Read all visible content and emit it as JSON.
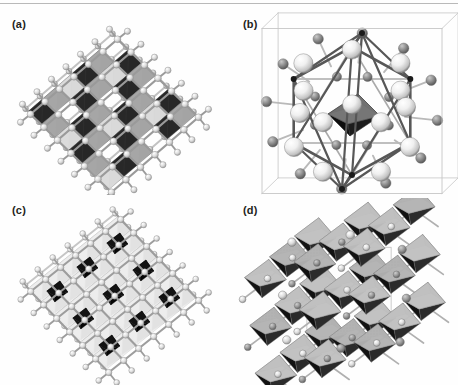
{
  "figure": {
    "type": "crystal-structure-figure",
    "background_color": "#fefefe",
    "top_rule_color": "#b9b9b9",
    "width": 458,
    "height": 385,
    "panel_count": 4,
    "layout": "2x2 grid"
  },
  "panels": [
    {
      "id": "a",
      "label": "(a)",
      "label_x": 12,
      "label_y": 22,
      "description": "Ball-and-stick crystal framework with black tetrahedra and gray tetrahedra arranged in diagonal chains",
      "render": "ball-stick-tetrahedra",
      "dark_polyhedra_color": "#121212",
      "mid_polyhedra_color": "#8f8f8f",
      "light_polyhedra_color": "#cfcfcf",
      "sphere_color": "#d8d8d8",
      "bond_color": "#9a9a9a",
      "cx": 112,
      "cy": 105,
      "sphere_radius": 3.4,
      "rows": 7,
      "cols": 7,
      "ax": 14.5,
      "ay": -12.5,
      "bx": 13.5,
      "by": 13.0
    },
    {
      "id": "b",
      "label": "(b)",
      "label_x": 243,
      "label_y": 22,
      "description": "Single unit cell in thin outlined box, large white cation spheres, small gray anion spheres, dark bond cage, central shaded octahedron",
      "render": "unit-cell-box",
      "box_color": "#c6c6c6",
      "cage_color": "#575757",
      "large_sphere_color": "#f2f2f2",
      "small_sphere_color": "#8a8a8a",
      "octahedron_top_color": "#8d8d8d",
      "octahedron_bottom_color": "#0e0e0e",
      "cx": 352,
      "cy": 103,
      "box_width": 180,
      "box_height": 165
    },
    {
      "id": "c",
      "label": "(c)",
      "label_x": 12,
      "label_y": 212,
      "description": "Ball-and-stick framework with black octahedral clusters and very light gray tetrahedra in a checkerboard arrangement",
      "render": "ball-stick-octahedra",
      "dark_polyhedra_color": "#101010",
      "mid_polyhedra_color": "#9d9d9d",
      "light_polyhedra_color": "#e2e2e2",
      "sphere_color": "#dedede",
      "bond_color": "#9d9d9d",
      "cx": 112,
      "cy": 293,
      "sphere_radius": 3.2,
      "rows": 7,
      "cols": 7,
      "ax": 15.0,
      "ay": -12.0,
      "bx": 13.0,
      "by": 13.5
    },
    {
      "id": "d",
      "label": "(d)",
      "label_x": 243,
      "label_y": 212,
      "description": "Dense 3x3 array of corner-sharing octahedra with light gray faces, stippled dotted faces and black shadowed faces, interconnected by gray spheres and bonds",
      "render": "octahedra-array",
      "face_light_color": "#c9c9c9",
      "face_mid_color": "#a6a6a6",
      "face_dark_color": "#121212",
      "stipple_color": "#6e6e6e",
      "sphere_color": "#8d8d8d",
      "bond_color": "#b0b0b0",
      "edge_color": "#7a7a7a",
      "cx": 345,
      "cy": 290,
      "grid": 3,
      "cell": 52
    }
  ],
  "legend_notes": {
    "visible_text_items": [
      "(a)",
      "(b)",
      "(c)",
      "(d)"
    ],
    "has_axis_labels": false,
    "has_scale_bar": false,
    "has_caption_text": false
  }
}
